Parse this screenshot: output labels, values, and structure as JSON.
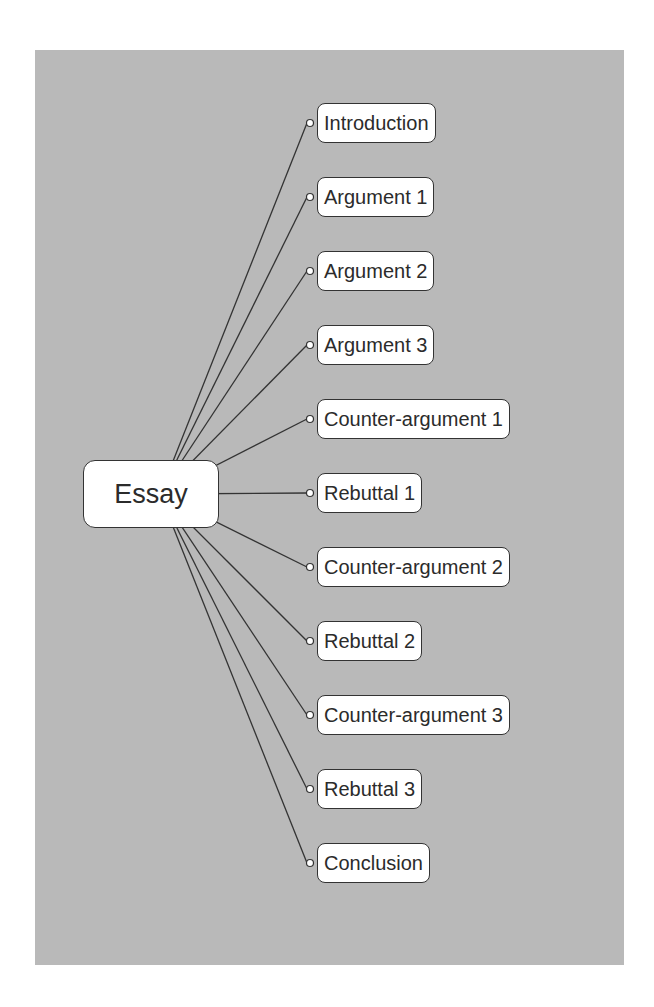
{
  "diagram": {
    "type": "mind-map",
    "root": {
      "label": "Essay"
    },
    "children": [
      {
        "label": "Introduction"
      },
      {
        "label": "Argument 1"
      },
      {
        "label": "Argument 2"
      },
      {
        "label": "Argument 3"
      },
      {
        "label": "Counter-argument 1"
      },
      {
        "label": "Rebuttal 1"
      },
      {
        "label": "Counter-argument 2"
      },
      {
        "label": "Rebuttal 2"
      },
      {
        "label": "Counter-argument 3"
      },
      {
        "label": "Rebuttal 3"
      },
      {
        "label": "Conclusion"
      }
    ]
  },
  "colors": {
    "background": "#b9b9b9",
    "node_fill": "#ffffff",
    "line": "#333333"
  }
}
